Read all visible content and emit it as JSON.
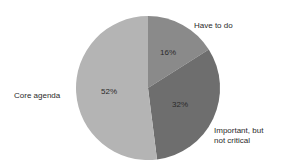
{
  "chart_data": {
    "type": "pie",
    "title": "",
    "categories": [
      "Have to do",
      "Important, but not critical",
      "Core agenda"
    ],
    "values": [
      16,
      32,
      52
    ],
    "value_labels": [
      "16%",
      "32%",
      "52%"
    ],
    "colors": [
      "#8a8a8a",
      "#6e6e6e",
      "#b4b4b4"
    ],
    "start_angle_deg": 0,
    "direction": "clockwise",
    "legend": "none (direct labels)"
  },
  "labels": {
    "have_to_do": "Have to do",
    "important_line1": "Important, but",
    "important_line2": "not critical",
    "core_agenda": "Core agenda"
  },
  "pct": {
    "have_to_do": "16%",
    "important": "32%",
    "core_agenda": "52%"
  }
}
